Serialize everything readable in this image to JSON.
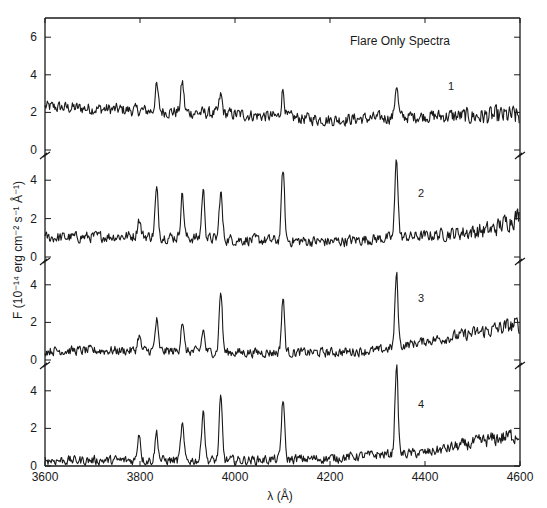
{
  "chart_data": {
    "type": "line",
    "title": "Flare Only Spectra",
    "xlabel": "λ (Å)",
    "ylabel": "F (10⁻¹⁴ erg cm⁻² s⁻¹ Å⁻¹)",
    "xlim": [
      3600,
      4600
    ],
    "x_ticks": [
      3600,
      3800,
      4000,
      4200,
      4400,
      4600
    ],
    "grid": false,
    "legend": "none",
    "panels": [
      {
        "name": "1",
        "ylim": [
          -0.5,
          7
        ],
        "y_ticks": [
          0,
          2,
          4,
          6
        ],
        "baseline": [
          [
            3600,
            2.3
          ],
          [
            3800,
            2.1
          ],
          [
            4000,
            1.9
          ],
          [
            4200,
            1.6
          ],
          [
            4400,
            1.8
          ],
          [
            4600,
            1.8
          ]
        ],
        "noise": 0.45,
        "lines": [
          {
            "wavelength": 3835,
            "peak": 3.4
          },
          {
            "wavelength": 3889,
            "peak": 3.6
          },
          {
            "wavelength": 3970,
            "peak": 2.9
          },
          {
            "wavelength": 4101,
            "peak": 3.2
          },
          {
            "wavelength": 4340,
            "peak": 3.5
          }
        ]
      },
      {
        "name": "2",
        "ylim": [
          -0.2,
          5.3
        ],
        "y_ticks": [
          0,
          2,
          4
        ],
        "baseline": [
          [
            3600,
            1.0
          ],
          [
            3800,
            1.1
          ],
          [
            4000,
            0.9
          ],
          [
            4200,
            0.8
          ],
          [
            4400,
            1.1
          ],
          [
            4540,
            1.4
          ],
          [
            4600,
            2.2
          ]
        ],
        "noise": 0.4,
        "lines": [
          {
            "wavelength": 3798,
            "peak": 2.0
          },
          {
            "wavelength": 3835,
            "peak": 3.5
          },
          {
            "wavelength": 3889,
            "peak": 3.3
          },
          {
            "wavelength": 3933,
            "peak": 3.5
          },
          {
            "wavelength": 3970,
            "peak": 3.4
          },
          {
            "wavelength": 4101,
            "peak": 4.6
          },
          {
            "wavelength": 4340,
            "peak": 5.2
          }
        ]
      },
      {
        "name": "3",
        "ylim": [
          -0.2,
          5.2
        ],
        "y_ticks": [
          0,
          2,
          4
        ],
        "baseline": [
          [
            3600,
            0.5
          ],
          [
            3800,
            0.5
          ],
          [
            4000,
            0.4
          ],
          [
            4200,
            0.4
          ],
          [
            4300,
            0.5
          ],
          [
            4400,
            1.0
          ],
          [
            4500,
            1.4
          ],
          [
            4600,
            1.9
          ]
        ],
        "noise": 0.35,
        "lines": [
          {
            "wavelength": 3798,
            "peak": 1.3
          },
          {
            "wavelength": 3835,
            "peak": 2.1
          },
          {
            "wavelength": 3889,
            "peak": 2.1
          },
          {
            "wavelength": 3933,
            "peak": 1.6
          },
          {
            "wavelength": 3970,
            "peak": 3.7
          },
          {
            "wavelength": 4101,
            "peak": 3.3
          },
          {
            "wavelength": 4340,
            "peak": 4.6
          }
        ]
      },
      {
        "name": "4",
        "ylim": [
          0,
          5.5
        ],
        "y_ticks": [
          0,
          2,
          4
        ],
        "baseline": [
          [
            3600,
            0.3
          ],
          [
            3800,
            0.3
          ],
          [
            4000,
            0.3
          ],
          [
            4200,
            0.4
          ],
          [
            4300,
            0.6
          ],
          [
            4400,
            0.7
          ],
          [
            4500,
            1.2
          ],
          [
            4600,
            1.7
          ]
        ],
        "noise": 0.35,
        "lines": [
          {
            "wavelength": 3798,
            "peak": 1.8
          },
          {
            "wavelength": 3835,
            "peak": 1.8
          },
          {
            "wavelength": 3889,
            "peak": 2.2
          },
          {
            "wavelength": 3933,
            "peak": 3.1
          },
          {
            "wavelength": 3970,
            "peak": 3.6
          },
          {
            "wavelength": 4101,
            "peak": 3.6
          },
          {
            "wavelength": 4340,
            "peak": 5.4
          }
        ]
      }
    ]
  },
  "colors": {
    "ink": "#1a1a1a",
    "background": "#ffffff"
  }
}
